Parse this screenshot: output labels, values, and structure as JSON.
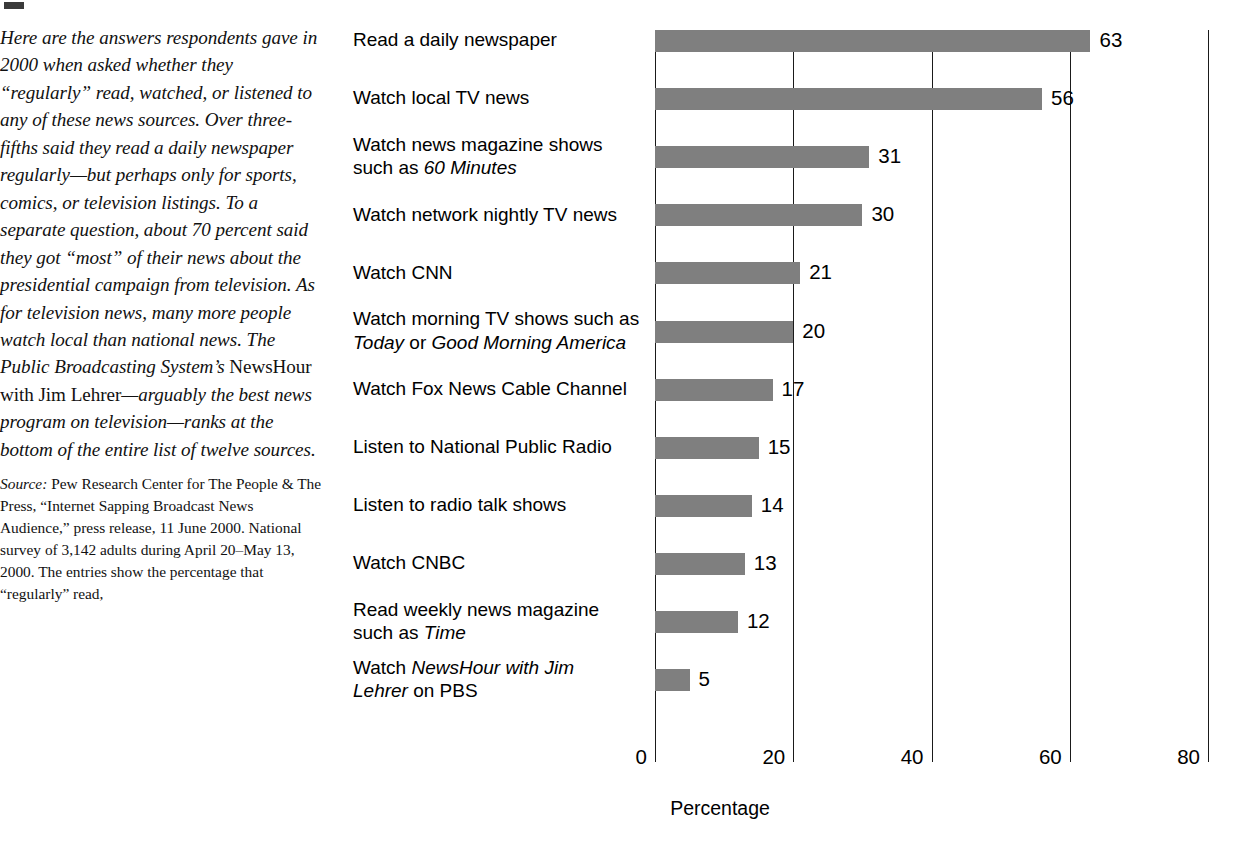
{
  "article": {
    "body_paragraph": "Here are the answers respondents gave in 2000 when asked whether they “regularly” read, watched, or listened to any of these news sources. Over three-fifths said they read a daily newspaper regularly—but perhaps only for sports, comics, or television listings. To a separate question, about 70 percent said they got “most” of their news about the presidential campaign from television. As for television news, many more people watch local than national news. The Public Broadcasting System’s ",
    "body_roman_phrase": "NewsHour with Jim Lehrer",
    "body_paragraph_end": "—arguably the best news program on television—ranks at the bottom of the entire list of twelve sources.",
    "source_label": "Source:",
    "source_text": " Pew Research Center for The People & The Press, “Internet Sapping Broadcast News Audience,” press release, 11 June 2000. National survey of 3,142 adults during April 20–May 13, 2000. The entries show the percentage that “regularly” read,"
  },
  "chart_data": {
    "type": "bar",
    "orientation": "horizontal",
    "title": "",
    "xlabel": "Percentage",
    "ylabel": "",
    "xlim": [
      0,
      80
    ],
    "xticks": [
      0,
      20,
      40,
      60,
      80
    ],
    "xticklabels": [
      "0",
      "20",
      "40",
      "60",
      "80"
    ],
    "grid": "vertical",
    "legend": "none",
    "bar_color": "#7f7f7f",
    "categories": [
      "Read a daily newspaper",
      "Watch local TV news",
      "Watch news magazine shows such as 60 Minutes",
      "Watch network nightly TV news",
      "Watch CNN",
      "Watch morning TV shows such as Today or Good Morning America",
      "Watch Fox News Cable Channel",
      "Listen to National Public Radio",
      "Listen to radio talk shows",
      "Watch CNBC",
      "Read weekly news magazine such as Time",
      "Watch NewsHour with Jim Lehrer on PBS"
    ],
    "values": [
      63,
      56,
      31,
      30,
      21,
      20,
      17,
      15,
      14,
      13,
      12,
      5
    ],
    "value_labels": [
      "63",
      "56",
      "31",
      "30",
      "21",
      "20",
      "17",
      "15",
      "14",
      "13",
      "12",
      "5"
    ],
    "category_lines": [
      [
        {
          "t": "Read a daily newspaper",
          "i": false
        }
      ],
      [
        {
          "t": "Watch local TV news",
          "i": false
        }
      ],
      [
        {
          "t": "Watch news magazine shows",
          "i": false
        },
        {
          "t": "such as ",
          "i": false,
          "t2": "60 Minutes",
          "i2": true
        }
      ],
      [
        {
          "t": "Watch network nightly TV news",
          "i": false
        }
      ],
      [
        {
          "t": "Watch CNN",
          "i": false
        }
      ],
      [
        {
          "t": "Watch morning TV shows such as",
          "i": false
        },
        {
          "t": "Today",
          "i": true,
          "t2": " or ",
          "i2": false,
          "t3": "Good Morning America",
          "i3": true
        }
      ],
      [
        {
          "t": "Watch Fox News Cable Channel",
          "i": false
        }
      ],
      [
        {
          "t": "Listen to National Public Radio",
          "i": false
        }
      ],
      [
        {
          "t": "Listen to radio talk shows",
          "i": false
        }
      ],
      [
        {
          "t": "Watch CNBC",
          "i": false
        }
      ],
      [
        {
          "t": "Read weekly news magazine",
          "i": false
        },
        {
          "t": "such as ",
          "i": false,
          "t2": "Time",
          "i2": true
        }
      ],
      [
        {
          "t": "Watch ",
          "i": false,
          "t2": "NewsHour with Jim",
          "i2": true
        },
        {
          "t": "Lehrer",
          "i": true,
          "t2": " on PBS",
          "i2": false
        }
      ]
    ]
  }
}
